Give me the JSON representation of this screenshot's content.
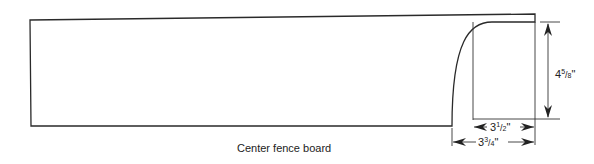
{
  "caption": "Center fence board",
  "dimensions": {
    "height": {
      "whole": "4",
      "num": "5",
      "den": "8",
      "unit": "\""
    },
    "flat_width": {
      "whole": "3",
      "num": "1",
      "den": "2",
      "unit": "\""
    },
    "total_width": {
      "whole": "3",
      "num": "3",
      "den": "4",
      "unit": "\""
    }
  },
  "colors": {
    "line": "#2a2a2a",
    "background": "#ffffff"
  }
}
